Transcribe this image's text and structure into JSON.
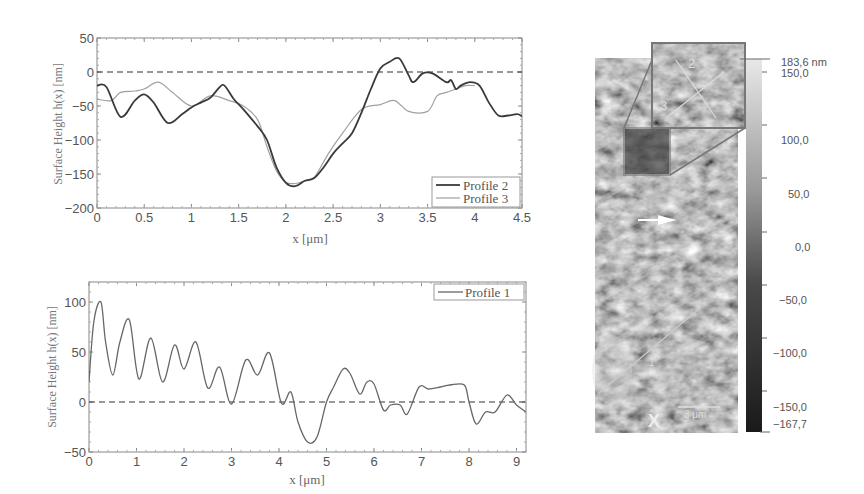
{
  "chart_data": [
    {
      "type": "line",
      "ylabel": "Surface Height h(x) [nm]",
      "xlabel": "x [μm]",
      "xlim": [
        0,
        4.5
      ],
      "ylim": [
        -200,
        50
      ],
      "xticks": [
        "0",
        "0.5",
        "1",
        "1.5",
        "2",
        "2.5",
        "3",
        "3.5",
        "4",
        "4.5"
      ],
      "yticks": [
        "50",
        "0",
        "-50",
        "-100",
        "-150",
        "-200"
      ],
      "zero_line": "dashed",
      "legend_position": "lower right",
      "series": [
        {
          "name": "Profile 2",
          "color": "#333333",
          "x": [
            0,
            0.1,
            0.25,
            0.4,
            0.5,
            0.6,
            0.75,
            0.9,
            1.0,
            1.1,
            1.2,
            1.3,
            1.35,
            1.45,
            1.55,
            1.7,
            1.8,
            1.9,
            2.0,
            2.1,
            2.2,
            2.3,
            2.4,
            2.5,
            2.6,
            2.7,
            2.8,
            2.9,
            3.0,
            3.1,
            3.2,
            3.3,
            3.35,
            3.45,
            3.55,
            3.7,
            3.75,
            3.8,
            3.85,
            3.95,
            4.05,
            4.15,
            4.25,
            4.35,
            4.45,
            4.5
          ],
          "y": [
            -20,
            -22,
            -66,
            -42,
            -33,
            -45,
            -75,
            -62,
            -52,
            -45,
            -38,
            -22,
            -20,
            -40,
            -55,
            -80,
            -100,
            -140,
            -163,
            -168,
            -160,
            -156,
            -140,
            -120,
            -105,
            -90,
            -60,
            -25,
            5,
            15,
            20,
            -5,
            -15,
            -2,
            -2,
            -15,
            -12,
            -25,
            -20,
            -15,
            -20,
            -45,
            -64,
            -64,
            -62,
            -65
          ]
        },
        {
          "name": "Profile 3",
          "color": "#9a9a9a",
          "x": [
            0,
            0.15,
            0.25,
            0.4,
            0.5,
            0.65,
            0.8,
            1.0,
            1.2,
            1.4,
            1.55,
            1.7,
            1.8,
            1.9,
            2.0,
            2.1,
            2.2,
            2.3,
            2.45,
            2.6,
            2.8,
            3.0,
            3.15,
            3.3,
            3.5,
            3.6,
            3.7,
            3.8,
            3.9,
            4.0
          ],
          "y": [
            -40,
            -42,
            -30,
            -28,
            -25,
            -15,
            -30,
            -50,
            -35,
            -42,
            -50,
            -70,
            -110,
            -145,
            -162,
            -164,
            -160,
            -155,
            -120,
            -90,
            -55,
            -48,
            -42,
            -58,
            -58,
            -35,
            -30,
            -25,
            -20,
            -20
          ]
        }
      ]
    },
    {
      "type": "line",
      "ylabel": "Surface Height h(x) [nm]",
      "xlabel": "x [μm]",
      "xlim": [
        0,
        9.2
      ],
      "ylim": [
        -50,
        120
      ],
      "xticks": [
        "0",
        "1",
        "2",
        "3",
        "4",
        "5",
        "6",
        "7",
        "8",
        "9"
      ],
      "yticks": [
        "100",
        "50",
        "0",
        "-50"
      ],
      "zero_line": "dashed",
      "legend_position": "upper right",
      "series": [
        {
          "name": "Profile 1",
          "color": "#555555",
          "x": [
            0,
            0.1,
            0.25,
            0.35,
            0.5,
            0.65,
            0.85,
            1.05,
            1.3,
            1.55,
            1.8,
            2.0,
            2.25,
            2.5,
            2.75,
            3.0,
            3.3,
            3.55,
            3.8,
            4.05,
            4.25,
            4.4,
            4.6,
            4.8,
            5.0,
            5.15,
            5.35,
            5.5,
            5.7,
            5.85,
            6.0,
            6.2,
            6.35,
            6.55,
            6.7,
            6.95,
            7.15,
            7.4,
            7.6,
            7.9,
            8.0,
            8.15,
            8.35,
            8.55,
            8.8,
            9.0,
            9.2
          ],
          "y": [
            20,
            80,
            100,
            60,
            27,
            60,
            82,
            23,
            64,
            20,
            57,
            33,
            60,
            14,
            35,
            -2,
            42,
            27,
            49,
            -1,
            10,
            -20,
            -40,
            -35,
            0,
            15,
            33,
            28,
            8,
            20,
            18,
            -8,
            -3,
            -3,
            -12,
            15,
            13,
            15,
            17,
            17,
            0,
            -22,
            -10,
            -10,
            7,
            -3,
            -10
          ]
        }
      ]
    },
    {
      "type": "heatmap",
      "title": "AFM surface topography",
      "colorbar": {
        "max_label": "183,6 nm",
        "min_label": "-167,7",
        "tick_labels": [
          "150,0",
          "100,0",
          "50,0",
          "0,0",
          "-50,0",
          "-100,0",
          "-150,0"
        ]
      },
      "annotations": [
        "1",
        "2",
        "3",
        "X",
        "3 μm"
      ]
    }
  ],
  "plot1": {
    "ylabel": "Surface Height h(x) [nm]",
    "xlabel": "x [μm]",
    "legend": [
      "Profile 2",
      "Profile 3"
    ]
  },
  "plot2": {
    "ylabel": "Surface Height h(x) [nm]",
    "xlabel": "x [μm]",
    "legend": [
      "Profile 1"
    ]
  },
  "afm": {
    "labels": {
      "l1": "1",
      "l2": "2",
      "l3": "3",
      "x": "X",
      "scale": "3 μm"
    },
    "colorbar": {
      "max": "183,6 nm",
      "min": "−167,7",
      "ticks": [
        "150,0",
        "100,0",
        "50,0",
        "0,0",
        "−50,0",
        "−100,0",
        "−150,0"
      ]
    }
  }
}
